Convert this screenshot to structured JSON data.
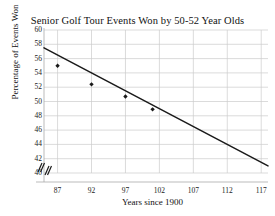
{
  "chart_data": {
    "type": "scatter",
    "title": "Senior Golf Tour Events Won by 50-52 Year Olds",
    "xlabel": "Years since 1900",
    "ylabel": "Percentage of Events Won",
    "xlim": [
      85,
      118
    ],
    "ylim": [
      40,
      60
    ],
    "xticks": [
      87,
      92,
      97,
      102,
      107,
      112,
      117
    ],
    "yticks": [
      40,
      42,
      44,
      46,
      48,
      50,
      52,
      54,
      56,
      58,
      60
    ],
    "grid": true,
    "legend": "none",
    "axis_break": "//",
    "points": [
      {
        "x": 87,
        "y": 55.0
      },
      {
        "x": 92,
        "y": 52.4
      },
      {
        "x": 97,
        "y": 50.7
      },
      {
        "x": 101,
        "y": 48.9
      }
    ],
    "trendline": {
      "x_start": 85,
      "y_start": 57.5,
      "x_end": 118,
      "y_end": 41.0
    },
    "colors": {
      "line": "#1a1a1a",
      "point": "#1a1a1a",
      "grid": "#cccccc",
      "axis": "#aaaaaa",
      "text": "#111111"
    }
  }
}
